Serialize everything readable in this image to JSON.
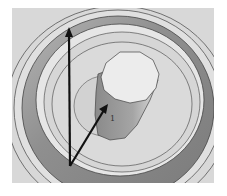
{
  "figure": {
    "background": "#ffffff",
    "panel_color": "#d9d9d9",
    "ring_dark": "#8a8a8a",
    "ring_light": "#e4e4e4",
    "cylinder_side": "#9a9a9a",
    "cylinder_top": "#e8e8e8",
    "arrow_color": "#111111",
    "label": "1"
  }
}
